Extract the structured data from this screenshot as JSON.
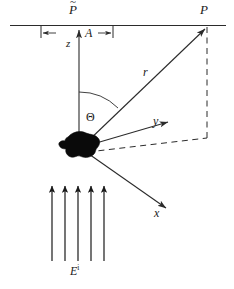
{
  "figure": {
    "labels": {
      "observation_point": "P",
      "projected_point_base": "P",
      "projected_point_accent": "~",
      "vertical_axis": "z",
      "aperture_span": "A",
      "range_vector": "r",
      "scattering_angle": "Θ",
      "y_axis": "y",
      "x_axis": "x",
      "incident_field_base": "E",
      "incident_field_superscript": "i"
    },
    "colors": {
      "stroke": "#2b2b2b",
      "scatterer_fill": "#000000",
      "background": "#ffffff"
    },
    "geometry": {
      "plane_line_y": 25,
      "plane_line_x_start": 10,
      "plane_line_x_end": 226,
      "tick_left_x": 41,
      "tick_right_x": 113,
      "scatterer_center_x": 79,
      "scatterer_center_y": 147,
      "observation_point_x": 207,
      "observation_point_y": 26,
      "incident_arrow_count": 5
    }
  }
}
